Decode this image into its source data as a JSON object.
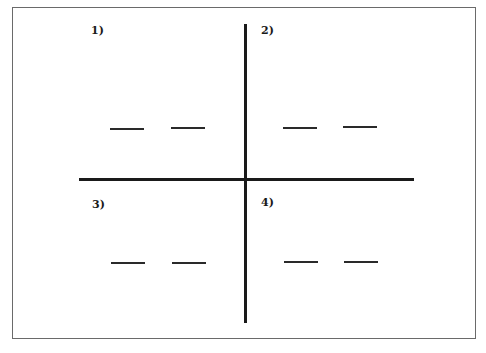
{
  "diagram": {
    "type": "quadrant-worksheet",
    "axes": {
      "horizontal": "thick black line",
      "vertical": "thick black line"
    },
    "quadrants": [
      {
        "label": "1)",
        "blanks": [
          "",
          ""
        ]
      },
      {
        "label": "2)",
        "blanks": [
          "",
          ""
        ]
      },
      {
        "label": "3)",
        "blanks": [
          "",
          ""
        ]
      },
      {
        "label": "4)",
        "blanks": [
          "",
          ""
        ]
      }
    ],
    "colors": {
      "line": "#1a1a1a",
      "frame": "#6a6a6a",
      "background": "#ffffff"
    }
  }
}
